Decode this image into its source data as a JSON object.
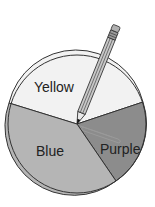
{
  "diagram": {
    "type": "spinner",
    "sections": [
      {
        "label": "Yellow",
        "color": "#f2f2f2"
      },
      {
        "label": "Blue",
        "color": "#b3b3b3"
      },
      {
        "label": "Purple",
        "color": "#8a8a8a"
      }
    ],
    "pointer": "pencil-and-paperclip"
  }
}
